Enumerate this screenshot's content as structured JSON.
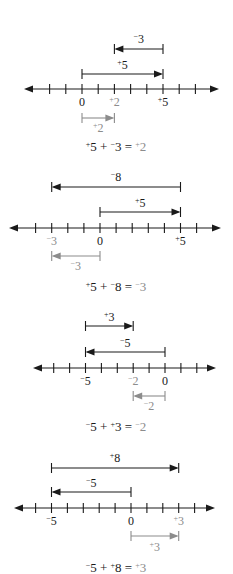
{
  "colors": {
    "ink": "#1a1a1a",
    "result": "#8c8c8c",
    "background": "#ffffff"
  },
  "unit_px_note": "scale: each integer tick ~16.2px",
  "problems": [
    {
      "id": "p1",
      "line": {
        "y": 89,
        "x_start": 24,
        "x_end": 219,
        "zero_x": 82,
        "unit": 16.2,
        "ticks": [
          -2,
          -1,
          0,
          1,
          2,
          3,
          4,
          5,
          6,
          7
        ]
      },
      "tick_labels": [
        {
          "value": 0,
          "text": "0",
          "sign": "",
          "gray": false
        },
        {
          "value": 2,
          "text": "2",
          "sign": "+",
          "gray": true
        },
        {
          "value": 5,
          "text": "5",
          "sign": "+",
          "gray": false
        }
      ],
      "tick_label_y": 106,
      "vectors": [
        {
          "from": 5,
          "to": 2,
          "y": 49,
          "label_sign": "−",
          "label_num": "3",
          "label_y": 43,
          "gray": false
        },
        {
          "from": 0,
          "to": 5,
          "y": 74,
          "label_sign": "+",
          "label_num": "5",
          "label_y": 69,
          "gray": false
        },
        {
          "from": 0,
          "to": 2,
          "y": 118,
          "label_sign": "+",
          "label_num": "2",
          "label_y": 132,
          "gray": true
        }
      ],
      "equation": {
        "y": 151,
        "a_sign": "+",
        "a": "5",
        "op": "+",
        "b_sign": "−",
        "b": "3",
        "eq": "=",
        "r_sign": "+",
        "r": "2"
      }
    },
    {
      "id": "p2",
      "line": {
        "y": 228,
        "x_start": 9,
        "x_end": 221,
        "zero_x": 100,
        "unit": 16.1,
        "ticks": [
          -4,
          -3,
          -2,
          -1,
          0,
          1,
          2,
          3,
          4,
          5,
          6
        ]
      },
      "tick_labels": [
        {
          "value": -3,
          "text": "3",
          "sign": "−",
          "gray": true
        },
        {
          "value": 0,
          "text": "0",
          "sign": "",
          "gray": false
        },
        {
          "value": 5,
          "text": "5",
          "sign": "+",
          "gray": false
        }
      ],
      "tick_label_y": 245,
      "vectors": [
        {
          "from": 5,
          "to": -3,
          "y": 187,
          "label_sign": "−",
          "label_num": "8",
          "label_y": 181,
          "gray": false
        },
        {
          "from": 0,
          "to": 5,
          "y": 212,
          "label_sign": "+",
          "label_num": "5",
          "label_y": 207,
          "gray": false
        },
        {
          "from": 0,
          "to": -3,
          "y": 256,
          "label_sign": "−",
          "label_num": "3",
          "label_y": 270,
          "gray": true
        }
      ],
      "equation": {
        "y": 291,
        "a_sign": "+",
        "a": "5",
        "op": "+",
        "b_sign": "−",
        "b": "8",
        "eq": "=",
        "r_sign": "−",
        "r": "3"
      }
    },
    {
      "id": "p3",
      "line": {
        "y": 368,
        "x_start": 33,
        "x_end": 216,
        "zero_x": 165,
        "unit": 15.9,
        "ticks": [
          -7,
          -6,
          -5,
          -4,
          -3,
          -2,
          -1,
          0,
          1,
          2
        ]
      },
      "tick_labels": [
        {
          "value": -5,
          "text": "5",
          "sign": "−",
          "gray": false
        },
        {
          "value": -2,
          "text": "2",
          "sign": "−",
          "gray": true
        },
        {
          "value": 0,
          "text": "0",
          "sign": "",
          "gray": false
        }
      ],
      "tick_label_y": 385,
      "vectors": [
        {
          "from": -5,
          "to": -2,
          "y": 326,
          "label_sign": "+",
          "label_num": "3",
          "label_y": 321,
          "gray": false
        },
        {
          "from": 0,
          "to": -5,
          "y": 352,
          "label_sign": "−",
          "label_num": "5",
          "label_y": 347,
          "gray": false
        },
        {
          "from": 0,
          "to": -2,
          "y": 396,
          "label_sign": "−",
          "label_num": "2",
          "label_y": 410,
          "gray": true
        }
      ],
      "equation": {
        "y": 431,
        "a_sign": "−",
        "a": "5",
        "op": "+",
        "b_sign": "+",
        "b": "3",
        "eq": "=",
        "r_sign": "−",
        "r": "2"
      }
    },
    {
      "id": "p4",
      "line": {
        "y": 508,
        "x_start": 14,
        "x_end": 215,
        "zero_x": 131,
        "unit": 15.9,
        "ticks": [
          -6,
          -5,
          -4,
          -3,
          -2,
          -1,
          0,
          1,
          2,
          3,
          4
        ]
      },
      "tick_labels": [
        {
          "value": -5,
          "text": "5",
          "sign": "−",
          "gray": false
        },
        {
          "value": 0,
          "text": "0",
          "sign": "",
          "gray": false
        },
        {
          "value": 3,
          "text": "3",
          "sign": "+",
          "gray": true
        }
      ],
      "tick_label_y": 525,
      "vectors": [
        {
          "from": -5,
          "to": 3,
          "y": 468,
          "label_sign": "+",
          "label_num": "8",
          "label_y": 462,
          "gray": false
        },
        {
          "from": 0,
          "to": -5,
          "y": 492,
          "label_sign": "−",
          "label_num": "5",
          "label_y": 487,
          "gray": false
        },
        {
          "from": 0,
          "to": 3,
          "y": 536,
          "label_sign": "+",
          "label_num": "3",
          "label_y": 551,
          "gray": true
        }
      ],
      "equation": {
        "y": 572,
        "a_sign": "−",
        "a": "5",
        "op": "+",
        "b_sign": "+",
        "b": "8",
        "eq": "=",
        "r_sign": "+",
        "r": "3"
      }
    }
  ]
}
